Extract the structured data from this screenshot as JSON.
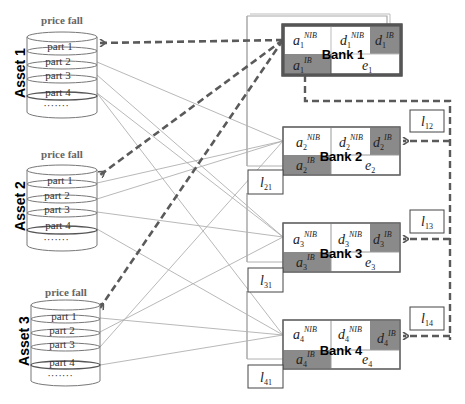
{
  "diagram": {
    "assets": [
      {
        "label": "Asset 1",
        "price_label": "price fall",
        "parts": [
          "part 1",
          "part 2",
          "part 3",
          "part 4"
        ],
        "ellipsis": "·······"
      },
      {
        "label": "Asset 2",
        "price_label": "price fall",
        "parts": [
          "part 1",
          "part 2",
          "part 3",
          "part 4"
        ],
        "ellipsis": "·······"
      },
      {
        "label": "Asset 3",
        "price_label": "price fall",
        "parts": [
          "part 1",
          "part 2",
          "part 3",
          "part 4"
        ],
        "ellipsis": "·······"
      }
    ],
    "banks": [
      {
        "label": "Bank 1",
        "index": "1",
        "cells": {
          "a_nib": "a",
          "d_nib": "d",
          "d_ib": "d",
          "a_ib": "a",
          "e": "e"
        },
        "sup_nib": "NIB",
        "sup_ib": "IB",
        "highlighted": true
      },
      {
        "label": "Bank 2",
        "index": "2",
        "cells": {
          "a_nib": "a",
          "d_nib": "d",
          "d_ib": "d",
          "a_ib": "a",
          "e": "e"
        },
        "sup_nib": "NIB",
        "sup_ib": "IB",
        "highlighted": false
      },
      {
        "label": "Bank 3",
        "index": "3",
        "cells": {
          "a_nib": "a",
          "d_nib": "d",
          "d_ib": "d",
          "a_ib": "a",
          "e": "e"
        },
        "sup_nib": "NIB",
        "sup_ib": "IB",
        "highlighted": false
      },
      {
        "label": "Bank 4",
        "index": "4",
        "cells": {
          "a_nib": "a",
          "d_nib": "d",
          "d_ib": "d",
          "a_ib": "a",
          "e": "e"
        },
        "sup_nib": "NIB",
        "sup_ib": "IB",
        "highlighted": false
      }
    ],
    "interbank_labels_left": [
      {
        "var": "l",
        "sub": "21"
      },
      {
        "var": "l",
        "sub": "31"
      },
      {
        "var": "l",
        "sub": "41"
      }
    ],
    "interbank_labels_right": [
      {
        "var": "l",
        "sub": "12"
      },
      {
        "var": "l",
        "sub": "13"
      },
      {
        "var": "l",
        "sub": "14"
      }
    ],
    "colors": {
      "shaded_cell": "#8a8a8a",
      "border": "#555555",
      "dashed_arrow": "#5a5a5a",
      "thin_line": "#b0b0b0"
    }
  }
}
